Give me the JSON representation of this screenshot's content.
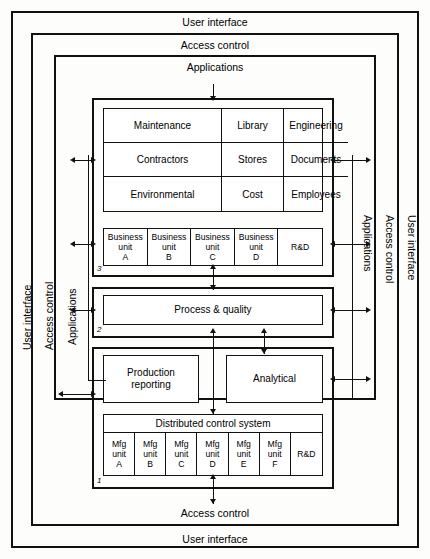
{
  "diagram": {
    "layers": [
      {
        "id": "user-interface",
        "label": "User interface"
      },
      {
        "id": "access-control",
        "label": "Access control"
      },
      {
        "id": "applications",
        "label": "Applications"
      }
    ],
    "top_bands": [
      {
        "label": "User interface"
      },
      {
        "label": "Access control"
      },
      {
        "label": "Applications"
      }
    ],
    "bottom_bands": [
      {
        "label": "Access control"
      },
      {
        "label": "User interface"
      }
    ],
    "side_labels_left": [
      "User interface",
      "Access control",
      "Applications"
    ],
    "side_labels_right": [
      "Applications",
      "Access control",
      "User interface"
    ],
    "application_grid": {
      "cells": [
        "Maintenance",
        "Library",
        "Engineering",
        "Contractors",
        "Stores",
        "Documents",
        "Environmental",
        "Cost",
        "Employees"
      ]
    },
    "business_units": {
      "tag": "3",
      "cells": [
        "Business\nunit\nA",
        "Business\nunit\nB",
        "Business\nunit\nC",
        "Business\nunit\nD",
        "R&D"
      ]
    },
    "process_quality": {
      "tag": "2",
      "label": "Process & quality"
    },
    "reporting": {
      "production": "Production\nreporting",
      "analytical": "Analytical"
    },
    "distributed_control": {
      "tag": "1",
      "header": "Distributed control system",
      "cells": [
        "Mfg\nunit\nA",
        "Mfg\nunit\nB",
        "Mfg\nunit\nC",
        "Mfg\nunit\nD",
        "Mfg\nunit\nE",
        "Mfg\nunit\nF",
        "R&D"
      ]
    },
    "colors": {
      "line": "#111111",
      "background": "#fdfdfb",
      "fill": "#ffffff"
    }
  }
}
